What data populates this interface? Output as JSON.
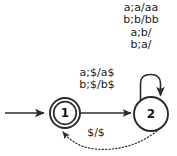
{
  "figure": {
    "type": "state-diagram",
    "background_color": "#ffffff",
    "stroke_color": "#2b2b2b",
    "text_color": "#1c1c1c"
  },
  "states": [
    {
      "id": "1",
      "label": "1",
      "shape": "double-circle",
      "accepting": true,
      "start": true,
      "cx": 65,
      "cy": 113,
      "r": 15
    },
    {
      "id": "2",
      "label": "2",
      "shape": "circle",
      "accepting": false,
      "start": false,
      "cx": 151,
      "cy": 114,
      "r": 17
    }
  ],
  "start_arrow": {
    "label": "",
    "from_x": 5,
    "to_x": 46,
    "y": 113
  },
  "transitions": [
    {
      "id": "t1-2",
      "from": "1",
      "to": "2",
      "style": "solid",
      "labels": [
        "a;$/a$",
        "b;$/b$"
      ]
    },
    {
      "id": "t2-2",
      "from": "2",
      "to": "2",
      "style": "solid",
      "kind": "self-loop",
      "labels": [
        "a;a/aa",
        "b;b/bb",
        "a;b/",
        "b;a/"
      ]
    },
    {
      "id": "t2-1",
      "from": "2",
      "to": "1",
      "style": "dotted",
      "labels": [
        "$/$"
      ]
    }
  ],
  "loop_labels": {
    "line1": "a;a/aa",
    "line2": "b;b/bb",
    "line3": "a;b/",
    "line4": "b;a/"
  },
  "edge12_labels": {
    "line1": "a;$/a$",
    "line2": "b;$/b$"
  },
  "return_label": {
    "text": "$/$"
  },
  "state_labels": {
    "one": "1",
    "two": "2"
  }
}
